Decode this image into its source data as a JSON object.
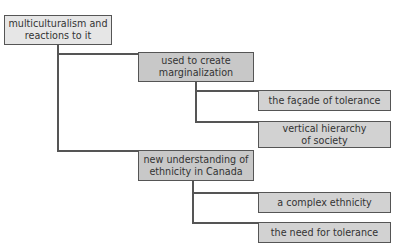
{
  "diagram": {
    "type": "tree",
    "root": {
      "label": "multiculturalism and reactions to it",
      "children": [
        {
          "label": "used to create marginalization",
          "children": [
            {
              "label": "the façade of tolerance"
            },
            {
              "label": "vertical hierarchy of society"
            }
          ]
        },
        {
          "label": "new understanding of ethnicity in Canada",
          "children": [
            {
              "label": "a complex ethnicity"
            },
            {
              "label": "the need for tolerance"
            }
          ]
        }
      ]
    }
  },
  "nodes": {
    "root": {
      "line1": "multiculturalism and",
      "line2": "reactions to it"
    },
    "branch1": {
      "line1": "used to create",
      "line2": "marginalization"
    },
    "leaf1": {
      "line1": "the façade of tolerance"
    },
    "leaf2": {
      "line1": "vertical hierarchy",
      "line2": "of society"
    },
    "branch2": {
      "line1": "new understanding of",
      "line2": "ethnicity in Canada"
    },
    "leaf3": {
      "line1": "a complex ethnicity"
    },
    "leaf4": {
      "line1": "the need for tolerance"
    }
  },
  "colors": {
    "root_fill": "#e6e6e6",
    "branch_fill": "#c8c8c8",
    "leaf_fill": "#d2d2d2",
    "line": "#555555"
  }
}
